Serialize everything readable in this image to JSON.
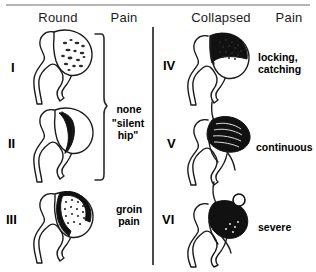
{
  "figure": {
    "title_implied": "Staging of osteonecrosis of the femoral head",
    "columns": {
      "left_morphology": "Round",
      "left_pain": "Pain",
      "right_morphology": "Collapsed",
      "right_pain": "Pain"
    },
    "divider_color": "#4a4a4a",
    "ink_color": "#111111",
    "background": "#ffffff"
  },
  "stages": [
    {
      "numeral": "I",
      "column": "left",
      "morphology": "Round",
      "pain": "none",
      "pain_note": "",
      "head_fill": "speckled-mottled",
      "icon": "femoral-head-stage-1-icon"
    },
    {
      "numeral": "II",
      "column": "left",
      "morphology": "Round",
      "pain": "none",
      "pain_note": "\"silent hip\"",
      "head_fill": "dark-crescent-band",
      "icon": "femoral-head-stage-2-icon"
    },
    {
      "numeral": "III",
      "column": "left",
      "morphology": "Round",
      "pain": "groin\npain",
      "pain_note": "",
      "head_fill": "dotted-wedge-dark-rim",
      "icon": "femoral-head-stage-3-icon"
    },
    {
      "numeral": "IV",
      "column": "right",
      "morphology": "Collapsed",
      "pain": "locking,\ncatching",
      "pain_note": "",
      "head_fill": "dark-stippled-flattened-dome",
      "icon": "femoral-head-stage-4-icon"
    },
    {
      "numeral": "V",
      "column": "right",
      "morphology": "Collapsed",
      "pain": "continuous",
      "pain_note": "",
      "head_fill": "black-collapsed-striated",
      "icon": "femoral-head-stage-5-icon"
    },
    {
      "numeral": "VI",
      "column": "right",
      "morphology": "Collapsed",
      "pain": "severe",
      "pain_note": "",
      "head_fill": "black-destroyed-loose-body",
      "icon": "femoral-head-stage-6-icon"
    }
  ],
  "brace": {
    "name": "pain-grouping-brace",
    "spans_stages": [
      "I",
      "II"
    ],
    "label_primary": "none",
    "label_secondary": "\"silent\nhip\""
  },
  "labels": {
    "none": "none",
    "silent_hip": "\"silent\nhip\"",
    "groin_pain": "groin\npain",
    "locking_catching": "locking,\ncatching",
    "continuous": "continuous",
    "severe": "severe"
  }
}
